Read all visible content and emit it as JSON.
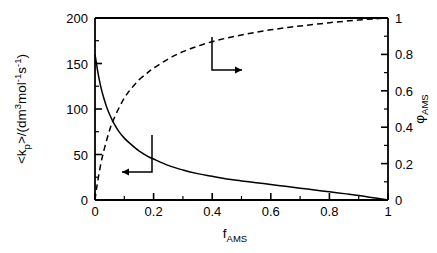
{
  "chart_data": {
    "type": "line",
    "title": "",
    "xlabel": "f_AMS",
    "xlabel_base": "f",
    "xlabel_sub": "AMS",
    "ylabel_left": "<k_p>/(dm3mol-1s-1)",
    "ylabel_right": "phi_AMS",
    "ylabel_right_base": "φ",
    "ylabel_right_sub": "AMS",
    "xlim": [
      0,
      1
    ],
    "ylim_left": [
      0,
      200
    ],
    "ylim_right": [
      0,
      1
    ],
    "xticks": [
      "0",
      "0.2",
      "0.4",
      "0.6",
      "0.8",
      "1"
    ],
    "xtick_values": [
      0,
      0.2,
      0.4,
      0.6,
      0.8,
      1
    ],
    "yticks_left": [
      "0",
      "50",
      "100",
      "150",
      "200"
    ],
    "ytick_values_left": [
      0,
      50,
      100,
      150,
      200
    ],
    "yticks_right": [
      "0",
      "0.2",
      "0.4",
      "0.6",
      "0.8",
      "1"
    ],
    "ytick_values_right": [
      0,
      0.2,
      0.4,
      0.6,
      0.8,
      1
    ],
    "xminor_step": 0.1,
    "yminor_step_left": 25,
    "yminor_step_right": 0.1,
    "grid": false,
    "legend": "none",
    "series": [
      {
        "name": "<k_p>",
        "axis": "left",
        "style": "solid",
        "color": "#000000",
        "x": [
          0,
          0.005,
          0.01,
          0.02,
          0.03,
          0.04,
          0.05,
          0.06,
          0.08,
          0.1,
          0.12,
          0.15,
          0.18,
          0.2,
          0.25,
          0.3,
          0.35,
          0.4,
          0.45,
          0.5,
          0.55,
          0.6,
          0.65,
          0.7,
          0.75,
          0.8,
          0.85,
          0.9,
          0.95,
          1
        ],
        "y": [
          160,
          150,
          140,
          124,
          112,
          102,
          94,
          87,
          76,
          68,
          62,
          54,
          48,
          45,
          38,
          33,
          29,
          26,
          23,
          21,
          19,
          17,
          15,
          13,
          11,
          9,
          7,
          5,
          2.5,
          0
        ]
      },
      {
        "name": "φ_AMS",
        "axis": "right",
        "style": "dashed",
        "color": "#000000",
        "x": [
          0,
          0.005,
          0.01,
          0.02,
          0.03,
          0.04,
          0.05,
          0.06,
          0.08,
          0.1,
          0.12,
          0.15,
          0.18,
          0.2,
          0.25,
          0.3,
          0.35,
          0.4,
          0.45,
          0.5,
          0.55,
          0.6,
          0.65,
          0.7,
          0.75,
          0.8,
          0.85,
          0.9,
          0.95,
          1
        ],
        "y": [
          0,
          0.06,
          0.11,
          0.2,
          0.27,
          0.33,
          0.385,
          0.43,
          0.5,
          0.56,
          0.605,
          0.66,
          0.7,
          0.725,
          0.775,
          0.815,
          0.845,
          0.87,
          0.89,
          0.907,
          0.922,
          0.935,
          0.946,
          0.956,
          0.965,
          0.974,
          0.982,
          0.989,
          0.995,
          1
        ]
      }
    ],
    "annotations": [
      {
        "name": "left-axis-pointer",
        "label": "",
        "points_to": "left",
        "description": "elbow arrow from solid curve pointing to left axis"
      },
      {
        "name": "right-axis-pointer",
        "label": "",
        "points_to": "right",
        "description": "elbow arrow from dashed curve pointing to right axis"
      }
    ]
  },
  "axis_labels": {
    "left_parts": {
      "lt": "<",
      "k": "k",
      "p": "p",
      "gt": ">",
      "slash_open": "/(dm",
      "three": "3",
      "mol": "mol",
      "minus_one_a": "-1",
      "s": "s",
      "minus_one_b": "-1",
      "close": ")"
    }
  },
  "colors": {
    "background": "#ffffff",
    "axis": "#000000",
    "curve": "#000000"
  }
}
